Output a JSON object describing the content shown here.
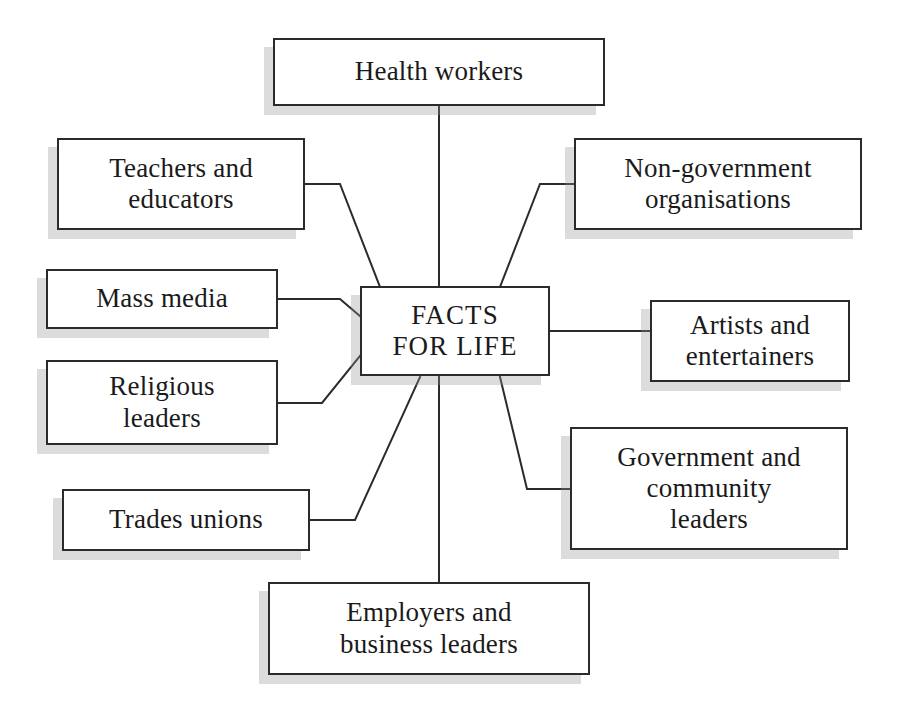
{
  "diagram": {
    "title": "FACTS FOR LIFE",
    "type": "hub-and-spoke",
    "style": {
      "box_border_color": "#2b2b2b",
      "box_fill_color": "#ffffff",
      "shadow_color": "#969696",
      "line_color": "#2b2b2b",
      "background_color": "#ffffff"
    },
    "hub": {
      "id": "hub",
      "label": "FACTS\nFOR LIFE",
      "line1": "FACTS",
      "line2": "FOR LIFE",
      "font_size": 27,
      "x": 360,
      "y": 286,
      "width": 190,
      "height": 90
    },
    "nodes": [
      {
        "id": "health-workers",
        "label": "Health workers",
        "font_size": 27,
        "x": 273,
        "y": 38,
        "width": 332,
        "height": 68
      },
      {
        "id": "teachers-and-educators",
        "label": "Teachers and\neducators",
        "font_size": 27,
        "x": 57,
        "y": 138,
        "width": 248,
        "height": 92
      },
      {
        "id": "mass-media",
        "label": "Mass media",
        "font_size": 27,
        "x": 46,
        "y": 269,
        "width": 232,
        "height": 60
      },
      {
        "id": "religious-leaders",
        "label": "Religious\nleaders",
        "font_size": 27,
        "x": 46,
        "y": 360,
        "width": 232,
        "height": 85
      },
      {
        "id": "trades-unions",
        "label": "Trades unions",
        "font_size": 27,
        "x": 62,
        "y": 489,
        "width": 248,
        "height": 62
      },
      {
        "id": "non-government-organisations",
        "label": "Non-government\norganisations",
        "font_size": 27,
        "x": 574,
        "y": 138,
        "width": 288,
        "height": 92
      },
      {
        "id": "artists-and-entertainers",
        "label": "Artists and\nentertainers",
        "font_size": 27,
        "x": 650,
        "y": 300,
        "width": 200,
        "height": 82
      },
      {
        "id": "government-and-community-leaders",
        "label": "Government and\ncommunity\nleaders",
        "font_size": 27,
        "x": 570,
        "y": 427,
        "width": 278,
        "height": 123
      },
      {
        "id": "employers-and-business-leaders",
        "label": "Employers and\nbusiness leaders",
        "font_size": 27,
        "x": 268,
        "y": 582,
        "width": 322,
        "height": 93
      }
    ],
    "connectors": [
      {
        "id": "edge-hub-health-workers",
        "from": "health-workers",
        "to": "hub",
        "points": "439,106 439,286"
      },
      {
        "id": "edge-hub-teachers-and-educators",
        "from": "teachers-and-educators",
        "to": "hub",
        "points": "305,184 340,184 380,287"
      },
      {
        "id": "edge-hub-mass-media",
        "from": "mass-media",
        "to": "hub",
        "points": "278,299 340,299 360,316"
      },
      {
        "id": "edge-hub-religious-leaders",
        "from": "religious-leaders",
        "to": "hub",
        "points": "278,403 322,403 360,356"
      },
      {
        "id": "edge-hub-trades-unions",
        "from": "trades-unions",
        "to": "hub",
        "points": "310,520 355,520 420,377"
      },
      {
        "id": "edge-hub-non-government-organisations",
        "from": "non-government-organisations",
        "to": "hub",
        "points": "574,184 540,184 500,287"
      },
      {
        "id": "edge-hub-artists-and-entertainers",
        "from": "artists-and-entertainers",
        "to": "hub",
        "points": "550,331 650,331"
      },
      {
        "id": "edge-hub-government-and-community-leaders",
        "from": "government-and-community-leaders",
        "to": "hub",
        "points": "570,489 527,489 500,377"
      },
      {
        "id": "edge-hub-employers-and-business-leaders",
        "from": "employers-and-business-leaders",
        "to": "hub",
        "points": "439,582 439,377"
      }
    ]
  }
}
